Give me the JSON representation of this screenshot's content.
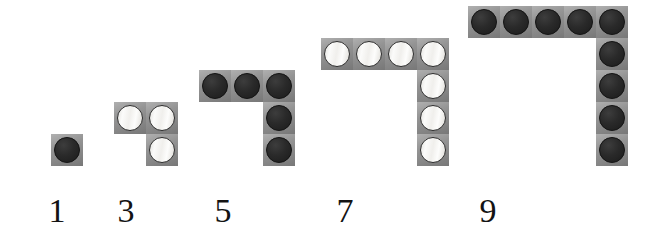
{
  "figure": {
    "background_color": "#ffffff",
    "tile_color": "#8e8e8e",
    "dark_counter_color": "#252525",
    "light_counter_color": "#f2f1ef",
    "counter_outline_color": "#2c2c2c",
    "label_color": "#131313",
    "cell_size_px": 32,
    "baseline_y_px": 166,
    "shapes": [
      {
        "id": "gnomon-1",
        "label": "1",
        "count": 1,
        "counter_style": "dark",
        "top_row_cells": 1,
        "column_cells_below": 0,
        "left_px": 51,
        "label_center_x_px": 57
      },
      {
        "id": "gnomon-3",
        "label": "3",
        "count": 3,
        "counter_style": "light",
        "top_row_cells": 2,
        "column_cells_below": 1,
        "left_px": 114,
        "label_center_x_px": 126
      },
      {
        "id": "gnomon-5",
        "label": "5",
        "count": 5,
        "counter_style": "dark",
        "top_row_cells": 3,
        "column_cells_below": 2,
        "left_px": 199,
        "label_center_x_px": 223
      },
      {
        "id": "gnomon-7",
        "label": "7",
        "count": 7,
        "counter_style": "light",
        "top_row_cells": 4,
        "column_cells_below": 3,
        "left_px": 321,
        "label_center_x_px": 345
      },
      {
        "id": "gnomon-9",
        "label": "9",
        "count": 9,
        "counter_style": "dark",
        "top_row_cells": 5,
        "column_cells_below": 4,
        "left_px": 468,
        "label_center_x_px": 488
      }
    ],
    "labels_baseline_y_px": 222,
    "sequence_text": "1  3  5  7  9"
  }
}
